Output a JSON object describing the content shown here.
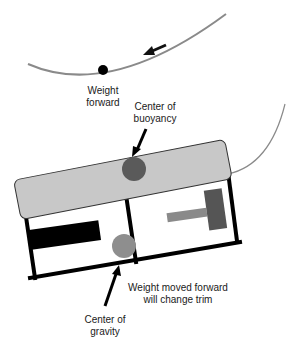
{
  "diagram": {
    "labels": {
      "weight_forward_line1": "Weight",
      "weight_forward_line2": "forward",
      "cob_line1": "Center of",
      "cob_line2": "buoyancy",
      "trim_line1": "Weight moved forward",
      "trim_line2": "will change trim",
      "cog_line1": "Center of",
      "cog_line2": "gravity"
    },
    "colors": {
      "curve": "#8a8a8a",
      "float": "#c8c8c8",
      "buoyancy_dot": "#5a5a5a",
      "gravity_dot": "#8e8e8e",
      "frame": "#000000",
      "t_handle": "#555555",
      "t_bar": "#8a8a8a"
    }
  }
}
